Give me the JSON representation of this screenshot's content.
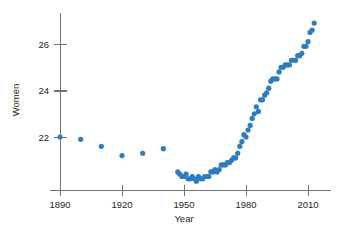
{
  "chart_data": {
    "type": "scatter",
    "title": "",
    "xlabel": "Year",
    "ylabel": "Women",
    "xlim": [
      1885,
      2016
    ],
    "ylim": [
      19.9,
      27.3
    ],
    "grid": false,
    "legend": "none",
    "marker_color": "#2e7cbf",
    "axis_color": "#6f7072",
    "xticks": [
      1890,
      1920,
      1950,
      1980,
      2010
    ],
    "xtick_labels": [
      "1890",
      "1920",
      "1950",
      "1980",
      "2010"
    ],
    "yticks": [
      22,
      24,
      26
    ],
    "ytick_labels": [
      "22",
      "24",
      "26"
    ],
    "series": [
      {
        "name": "Median age at first marriage, Women",
        "x": [
          1890,
          1900,
          1910,
          1920,
          1930,
          1940,
          1947,
          1948,
          1949,
          1950,
          1951,
          1952,
          1953,
          1954,
          1955,
          1956,
          1957,
          1958,
          1959,
          1960,
          1961,
          1962,
          1963,
          1964,
          1965,
          1966,
          1967,
          1968,
          1969,
          1970,
          1971,
          1972,
          1973,
          1974,
          1975,
          1976,
          1977,
          1978,
          1979,
          1980,
          1981,
          1982,
          1983,
          1984,
          1985,
          1986,
          1987,
          1988,
          1989,
          1990,
          1991,
          1992,
          1993,
          1994,
          1995,
          1996,
          1997,
          1998,
          1999,
          2000,
          2001,
          2002,
          2003,
          2004,
          2005,
          2006,
          2007,
          2008,
          2009,
          2010,
          2011,
          2012,
          2013
        ],
        "y": [
          22.0,
          21.9,
          21.6,
          21.2,
          21.3,
          21.5,
          20.5,
          20.4,
          20.3,
          20.3,
          20.4,
          20.2,
          20.2,
          20.3,
          20.2,
          20.1,
          20.3,
          20.2,
          20.2,
          20.3,
          20.3,
          20.3,
          20.5,
          20.5,
          20.6,
          20.5,
          20.6,
          20.8,
          20.8,
          20.8,
          20.9,
          20.9,
          21.0,
          21.1,
          21.1,
          21.3,
          21.6,
          21.8,
          22.1,
          22.0,
          22.3,
          22.5,
          22.8,
          23.0,
          23.3,
          23.1,
          23.6,
          23.6,
          23.8,
          23.9,
          24.1,
          24.4,
          24.5,
          24.5,
          24.5,
          24.8,
          25.0,
          25.0,
          25.1,
          25.1,
          25.1,
          25.3,
          25.3,
          25.3,
          25.5,
          25.5,
          25.6,
          25.9,
          25.9,
          26.1,
          26.5,
          26.6,
          26.9
        ]
      }
    ]
  },
  "axis_titles": {
    "x": "Year",
    "y": "Women"
  }
}
